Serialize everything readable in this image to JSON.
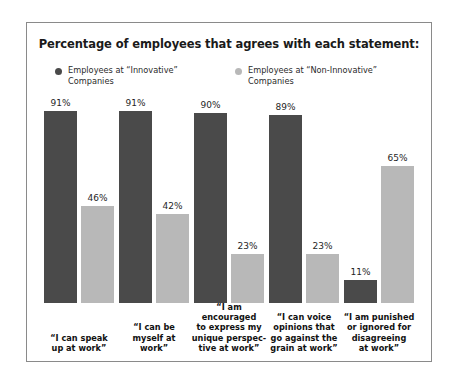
{
  "chart_data": {
    "type": "bar",
    "title": "Percentage of employees that agrees with each statement:",
    "xlabel": "",
    "ylabel": "",
    "ylim": [
      0,
      100
    ],
    "grid": false,
    "legend_position": "top",
    "value_suffix": "%",
    "colors": {
      "innovative": "#4a4a4a",
      "non_innovative": "#b8b8b8",
      "frame": "#8a8a8a",
      "background": "#ffffff",
      "text": "#1a1a1a"
    },
    "categories": [
      "“I can speak up at work”",
      "“I can be myself at work”",
      "“I am encouraged to express my unique perspec-tive at work”",
      "“I can voice opinions that go against the grain at work”",
      "“I am punished or ignored for disagreeing at work”"
    ],
    "category_lines": [
      [
        "“I can speak",
        "up at work”"
      ],
      [
        "“I can be",
        "myself at",
        "work”"
      ],
      [
        "“I am encouraged",
        "to express my",
        "unique perspec-",
        "tive at work”"
      ],
      [
        "“I can voice",
        "opinions that",
        "go against the",
        "grain at work”"
      ],
      [
        "“I am punished",
        "or ignored for",
        "disagreeing",
        "at work”"
      ]
    ],
    "series": [
      {
        "name": "Employees at “Innovative” Companies",
        "color": "#4a4a4a",
        "values": [
          91,
          91,
          90,
          89,
          11
        ],
        "labels": [
          "91%",
          "91%",
          "90%",
          "89%",
          "11%"
        ]
      },
      {
        "name": "Employees at “Non-Innovative” Companies",
        "color": "#b8b8b8",
        "values": [
          46,
          42,
          23,
          23,
          65
        ],
        "labels": [
          "46%",
          "42%",
          "23%",
          "23%",
          "65%"
        ]
      }
    ]
  },
  "legend": {
    "items": [
      {
        "label_line1": "Employees at “Innovative”",
        "label_line2": "Companies",
        "color": "#4a4a4a"
      },
      {
        "label_line1": "Employees at “Non-Innovative”",
        "label_line2": "Companies",
        "color": "#b8b8b8"
      }
    ]
  }
}
